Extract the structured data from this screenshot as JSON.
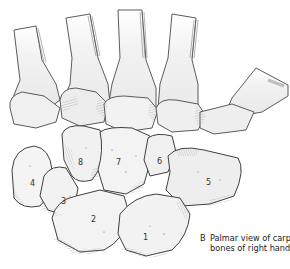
{
  "figure": {
    "panel_letter": "B",
    "caption_line1": "Palmar view of carpal",
    "caption_line2": "bones of right hand",
    "colors": {
      "bone_fill": "#f4f4f4",
      "bone_shade": "#d9d9d9",
      "outline": "#4a4a4a",
      "hatch": "#8a8a8a",
      "background": "#ffffff"
    }
  },
  "labels": [
    {
      "id": "1",
      "text": "1",
      "x": 143,
      "y": 240
    },
    {
      "id": "2",
      "text": "2",
      "x": 91,
      "y": 222
    },
    {
      "id": "3",
      "text": "3",
      "x": 61,
      "y": 204
    },
    {
      "id": "4",
      "text": "4",
      "x": 30,
      "y": 186
    },
    {
      "id": "5",
      "text": "5",
      "x": 206,
      "y": 185
    },
    {
      "id": "6",
      "text": "6",
      "x": 157,
      "y": 164
    },
    {
      "id": "7",
      "text": "7",
      "x": 116,
      "y": 165
    },
    {
      "id": "8",
      "text": "8",
      "x": 78,
      "y": 165
    }
  ]
}
